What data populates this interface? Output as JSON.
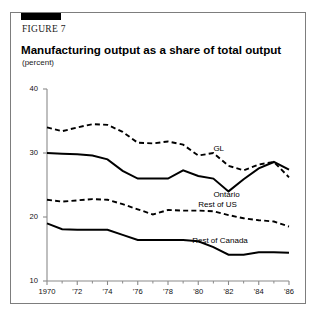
{
  "figure": {
    "number_label": "FIGURE 7",
    "title": "Manufacturing output as a share of total output",
    "subtitle": "(percent)"
  },
  "chart_data": {
    "type": "line",
    "title": "Manufacturing output as a share of total output",
    "subtitle": "(percent)",
    "xlabel": "",
    "ylabel": "percent",
    "ylim": [
      10,
      40
    ],
    "yticks": [
      10,
      20,
      30,
      40
    ],
    "ytick_labels": [
      "10",
      "20",
      "30",
      "40"
    ],
    "xlim": [
      1970,
      1986
    ],
    "xticks": [
      1970,
      1972,
      1974,
      1976,
      1978,
      1980,
      1982,
      1984,
      1986
    ],
    "xtick_labels": [
      "1970",
      "'72",
      "'74",
      "'76",
      "'78",
      "'80",
      "'82",
      "'84",
      "'86"
    ],
    "minor_xticks": [
      1971,
      1973,
      1975,
      1977,
      1979,
      1981,
      1983,
      1985
    ],
    "grid": false,
    "legend_position": "inline-annotations",
    "x": [
      1970,
      1971,
      1972,
      1973,
      1974,
      1975,
      1976,
      1977,
      1978,
      1979,
      1980,
      1981,
      1982,
      1983,
      1984,
      1985,
      1986
    ],
    "series": [
      {
        "name": "GL",
        "style": "dashed",
        "color": "#000000",
        "label": "GL",
        "values": [
          34.0,
          33.4,
          34.0,
          34.5,
          34.4,
          33.3,
          31.6,
          31.5,
          31.8,
          31.3,
          29.6,
          30.0,
          28.0,
          27.3,
          28.2,
          28.6,
          26.2
        ]
      },
      {
        "name": "Ontario",
        "style": "solid",
        "color": "#000000",
        "label": "Ontario",
        "values": [
          30.0,
          29.9,
          29.8,
          29.6,
          29.0,
          27.2,
          26.0,
          26.0,
          26.0,
          27.3,
          26.4,
          26.0,
          24.0,
          25.9,
          27.6,
          28.6,
          27.4
        ]
      },
      {
        "name": "Rest of US",
        "style": "dashed",
        "color": "#000000",
        "label": "Rest of US",
        "values": [
          22.7,
          22.4,
          22.6,
          22.8,
          22.7,
          22.0,
          21.2,
          20.4,
          21.1,
          21.0,
          21.0,
          20.9,
          20.3,
          19.8,
          19.5,
          19.3,
          18.5
        ]
      },
      {
        "name": "Rest of Canada",
        "style": "solid",
        "color": "#000000",
        "label": "Rest of Canada",
        "values": [
          19.0,
          18.1,
          18.0,
          18.0,
          18.0,
          17.2,
          16.4,
          16.4,
          16.4,
          16.4,
          16.2,
          15.3,
          14.1,
          14.1,
          14.5,
          14.5,
          14.4
        ]
      }
    ],
    "annotations": [
      {
        "text": "GL",
        "x": 1981,
        "y": 30.6
      },
      {
        "text": "Ontario",
        "x": 1981,
        "y": 23.4
      },
      {
        "text": "Rest of US",
        "x": 1980,
        "y": 21.9
      },
      {
        "text": "Rest of Canada",
        "x": 1979.6,
        "y": 16.3
      }
    ]
  },
  "colors": {
    "background": "#ffffff",
    "frame": "#7d7d7d",
    "accent": "#000000",
    "axis": "#8a8a8a",
    "ink": "#000000"
  }
}
